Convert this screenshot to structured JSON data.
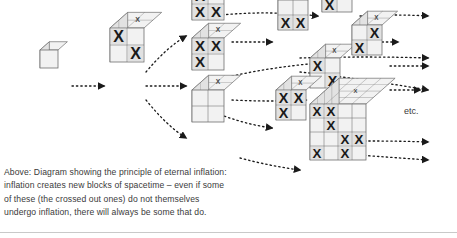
{
  "figure": {
    "title_text": "",
    "etc_label": "etc.",
    "caption": "Above: Diagram showing the principle of eternal inflation:\ninflation creates new blocks of spacetime – even if some\nof these (the crossed out ones) do not themselves\nundergo inflation, there will always be some that do.",
    "colors": {
      "face_light": "#f2f2f2",
      "face_mid": "#e2e2e2",
      "face_dark": "#d0d0d0",
      "stroke": "#6e6e6e",
      "mark": "#1a1a1a",
      "arrow": "#1a1a1a",
      "text": "#3a3a3a",
      "background": "#ffffff"
    },
    "generations": [
      {
        "id": "gen1",
        "label": "seed-block",
        "x": 40,
        "y": 68,
        "grid": 1,
        "cell": 18,
        "crossed_cells": []
      },
      {
        "id": "gen2",
        "label": "first-inflation-block",
        "x": 110,
        "y": 62,
        "grid": 2,
        "cell": 17,
        "crossed_cells": [
          "0,0",
          "1,1"
        ]
      },
      {
        "id": "gen3-top",
        "label": "branch-top-block",
        "x": 192,
        "y": 20,
        "grid": 2,
        "cell": 16,
        "crossed_cells": [
          "0,0",
          "1,0",
          "1,1"
        ]
      },
      {
        "id": "gen3-mid",
        "label": "branch-middle-block",
        "x": 192,
        "y": 70,
        "grid": 2,
        "cell": 16,
        "crossed_cells": [
          "0,0",
          "0,1",
          "1,0"
        ]
      },
      {
        "id": "gen3-bottom",
        "label": "branch-bottom-block",
        "x": 192,
        "y": 122,
        "grid": 2,
        "cell": 16,
        "crossed_cells": []
      },
      {
        "id": "gen4-a",
        "label": "block-row1-col3",
        "x": 278,
        "y": 30,
        "grid": 2,
        "cell": 15,
        "crossed_cells": [
          "1,0",
          "1,1"
        ]
      },
      {
        "id": "gen4-b",
        "label": "block-row2-col3",
        "x": 310,
        "y": 88,
        "grid": 2,
        "cell": 15,
        "crossed_cells": [
          "0,0",
          "1,1"
        ]
      },
      {
        "id": "gen4-c",
        "label": "block-row3-col3",
        "x": 276,
        "y": 120,
        "grid": 2,
        "cell": 15,
        "crossed_cells": [
          "0,0",
          "0,1",
          "1,0"
        ]
      },
      {
        "id": "gen5-a",
        "label": "block-row1-col4",
        "x": 322,
        "y": 12,
        "grid": 2,
        "cell": 15,
        "crossed_cells": [
          "0,0",
          "0,1",
          "1,0"
        ]
      },
      {
        "id": "gen5-b",
        "label": "block-row2-col4",
        "x": 352,
        "y": 55,
        "grid": 2,
        "cell": 15,
        "crossed_cells": [
          "0,1",
          "1,0"
        ]
      },
      {
        "id": "gen6-big",
        "label": "large-inflation-block",
        "x": 310,
        "y": 160,
        "grid": 4,
        "cell": 14,
        "crossed_cells": [
          "0,0",
          "0,1",
          "1,1",
          "2,2",
          "2,3",
          "3,0",
          "3,2"
        ]
      }
    ],
    "arrows": [
      {
        "id": "a1",
        "from": [
          72,
          86
        ],
        "to": [
          104,
          86
        ],
        "curve": 0
      },
      {
        "id": "a2",
        "from": [
          146,
          72
        ],
        "to": [
          186,
          36
        ],
        "curve": -6
      },
      {
        "id": "a3",
        "from": [
          146,
          86
        ],
        "to": [
          186,
          86
        ],
        "curve": 0
      },
      {
        "id": "a4",
        "from": [
          146,
          100
        ],
        "to": [
          186,
          138
        ],
        "curve": 6
      },
      {
        "id": "a5",
        "from": [
          196,
          18
        ],
        "to": [
          318,
          16
        ],
        "curve": -8
      },
      {
        "id": "a6",
        "from": [
          232,
          42
        ],
        "to": [
          272,
          42
        ],
        "curve": 0
      },
      {
        "id": "a7",
        "from": [
          232,
          76
        ],
        "to": [
          334,
          62
        ],
        "curve": -4
      },
      {
        "id": "a8",
        "from": [
          232,
          100
        ],
        "to": [
          306,
          100
        ],
        "curve": 2
      },
      {
        "id": "a9",
        "from": [
          200,
          106
        ],
        "to": [
          272,
          128
        ],
        "curve": 6
      },
      {
        "id": "a10",
        "from": [
          360,
          16
        ],
        "to": [
          428,
          16
        ],
        "curve": -2
      },
      {
        "id": "a11",
        "from": [
          360,
          42
        ],
        "to": [
          398,
          42
        ],
        "curve": 0
      },
      {
        "id": "a12",
        "from": [
          300,
          58
        ],
        "to": [
          428,
          58
        ],
        "curve": -2
      },
      {
        "id": "a13",
        "from": [
          390,
          66
        ],
        "to": [
          428,
          66
        ],
        "curve": 0
      },
      {
        "id": "a14",
        "from": [
          390,
          90
        ],
        "to": [
          420,
          90
        ],
        "curve": 0
      },
      {
        "id": "a15",
        "from": [
          300,
          72
        ],
        "to": [
          428,
          90
        ],
        "curve": -2
      },
      {
        "id": "a16",
        "from": [
          316,
          142
        ],
        "to": [
          428,
          142
        ],
        "curve": -2
      },
      {
        "id": "a17",
        "from": [
          316,
          152
        ],
        "to": [
          428,
          160
        ],
        "curve": 0
      },
      {
        "id": "a18",
        "from": [
          240,
          158
        ],
        "to": [
          300,
          170
        ],
        "curve": 2
      }
    ]
  }
}
